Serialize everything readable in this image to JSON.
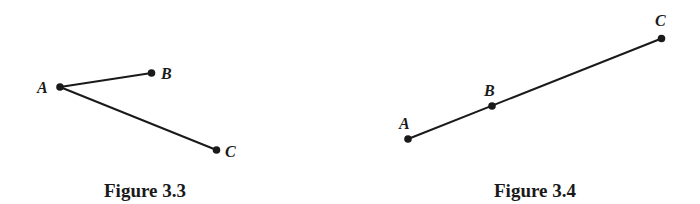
{
  "figures": [
    {
      "caption": "Figure 3.3",
      "caption_pos": [
        145,
        197
      ],
      "points": [
        {
          "label": "A",
          "x": 60,
          "y": 87,
          "lx": 37,
          "ly": 93
        },
        {
          "label": "B",
          "x": 151.5,
          "y": 73,
          "lx": 161,
          "ly": 79
        },
        {
          "label": "C",
          "x": 216.5,
          "y": 150,
          "lx": 225,
          "ly": 157
        }
      ],
      "segments": [
        [
          "A",
          "B"
        ],
        [
          "A",
          "C"
        ]
      ]
    },
    {
      "caption": "Figure 3.4",
      "caption_pos": [
        535,
        197
      ],
      "points": [
        {
          "label": "A",
          "x": 408,
          "y": 139,
          "lx": 399,
          "ly": 129
        },
        {
          "label": "B",
          "x": 492,
          "y": 106,
          "lx": 484,
          "ly": 96
        },
        {
          "label": "C",
          "x": 661.5,
          "y": 38.5,
          "lx": 655,
          "ly": 26
        }
      ],
      "segments": [
        [
          "A",
          "B"
        ],
        [
          "B",
          "C"
        ]
      ]
    }
  ],
  "colors": {
    "ink": "#1a1a1a",
    "background": "#ffffff"
  }
}
